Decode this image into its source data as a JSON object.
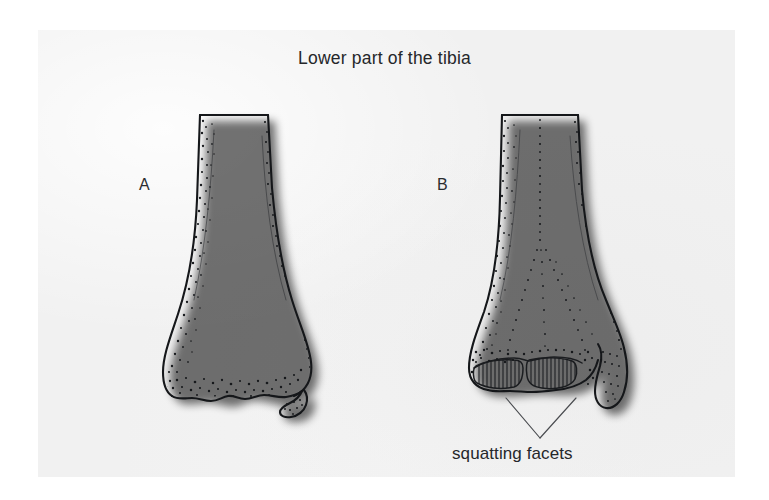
{
  "figure": {
    "title": "Lower part of the tibia",
    "caption": "squatting facets",
    "panels": [
      {
        "letter": "A",
        "description": "distal tibia without squatting facets"
      },
      {
        "letter": "B",
        "description": "distal tibia with squatting facets"
      }
    ],
    "background_color": "#f1f1f1",
    "outer_color": "#ffffff",
    "ink_color": "#15171a",
    "text_color": "#25272a"
  }
}
